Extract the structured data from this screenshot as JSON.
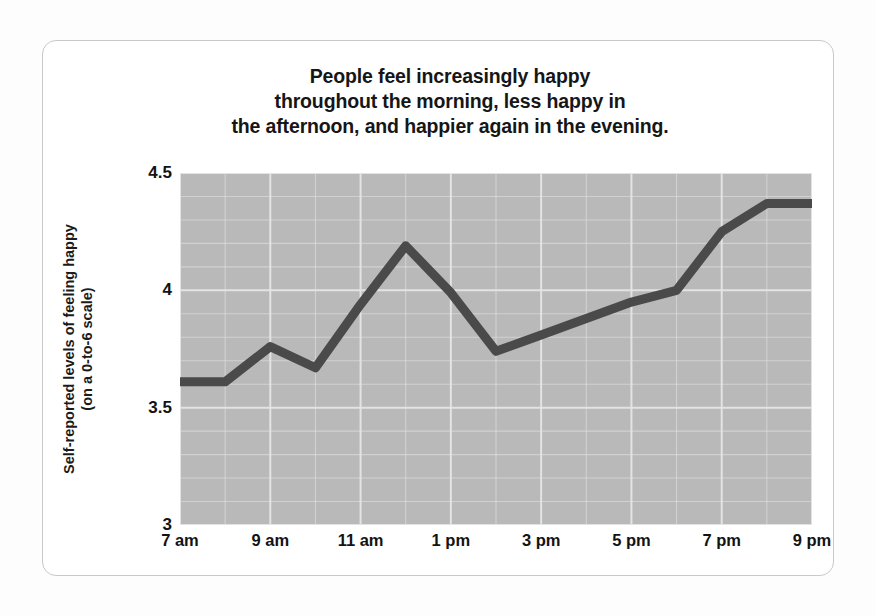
{
  "chart_data": {
    "type": "line",
    "title": "People feel increasingly happy throughout the morning, less happy in the afternoon, and happier again in the evening.",
    "title_lines": [
      "People feel increasingly happy",
      "throughout the morning, less happy in",
      "the afternoon, and happier again in the evening."
    ],
    "xlabel": "",
    "ylabel": "Self-reported levels of feeling happy (on a 0-to-6 scale)",
    "ylabel_lines": [
      "Self-reported levels of feeling happy",
      "(on a 0-to-6 scale)"
    ],
    "xlim": [
      7,
      21
    ],
    "ylim": [
      3,
      4.5
    ],
    "yticks": [
      "4.5",
      "4",
      "3.5",
      "3"
    ],
    "ytick_values": [
      4.5,
      4,
      3.5,
      3
    ],
    "xticks": [
      "7 am",
      "9 am",
      "11 am",
      "1 pm",
      "3 pm",
      "5 pm",
      "7 pm",
      "9 pm"
    ],
    "xtick_values": [
      7,
      9,
      11,
      13,
      15,
      17,
      19,
      21
    ],
    "x": [
      7,
      8,
      9,
      10,
      11,
      12,
      13,
      14,
      15,
      16,
      17,
      18,
      19,
      20,
      21
    ],
    "x_labels": [
      "7 am",
      "8 am",
      "9 am",
      "10 am",
      "11 am",
      "12 pm",
      "1 pm",
      "2 pm",
      "3 pm",
      "4 pm",
      "5 pm",
      "6 pm",
      "7 pm",
      "8 pm",
      "9 pm"
    ],
    "values": [
      3.61,
      3.61,
      3.76,
      3.67,
      3.94,
      4.19,
      3.99,
      3.74,
      3.81,
      3.88,
      3.95,
      4.0,
      4.25,
      4.37,
      4.37
    ],
    "grid": true,
    "grid_color": "#e6e6e6",
    "plot_background": "#b9b9b9",
    "line_color": "#4a4a4a",
    "line_width": 9,
    "legend": "none",
    "legend_position": "none"
  },
  "figure": {
    "background": "#ffffff",
    "frame_color": "#c9c9c9",
    "text_color": "#161616"
  }
}
